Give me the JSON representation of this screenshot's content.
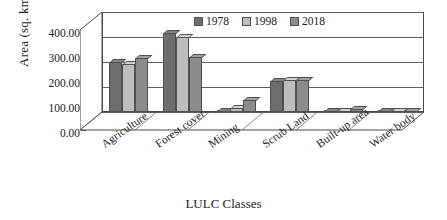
{
  "chart_data": {
    "type": "bar",
    "title": "",
    "xlabel": "LULC Classes",
    "ylabel": "Area (sq. km.)",
    "categories": [
      "Agriculture",
      "Forest cover",
      "Mining",
      "Scrub Land",
      "Built-up area",
      "Water body"
    ],
    "series": [
      {
        "name": "1978",
        "color": "#6e6e6e",
        "values": [
          200.0,
          315.0,
          5.0,
          126.0,
          3.0,
          4.0
        ]
      },
      {
        "name": "1998",
        "color": "#bdbdbd",
        "values": [
          192.0,
          300.0,
          18.0,
          127.0,
          6.0,
          5.0
        ]
      },
      {
        "name": "2018",
        "color": "#8c8c8c",
        "values": [
          215.0,
          222.0,
          50.0,
          128.0,
          11.0,
          5.0
        ]
      }
    ],
    "ylim": [
      0,
      400
    ],
    "ytick_labels": [
      "400.00",
      "300.00",
      "200.00",
      "100.00",
      "0.00"
    ],
    "ytick_values": [
      400,
      300,
      200,
      100,
      0
    ],
    "grid": true,
    "legend_position": "top",
    "style": "3d-clustered-column"
  },
  "axis": {
    "y_title": "Area (sq. km.)",
    "x_title": "LULC Classes"
  },
  "legend": {
    "items": [
      {
        "label": "1978",
        "color": "#6e6e6e"
      },
      {
        "label": "1998",
        "color": "#bdbdbd"
      },
      {
        "label": "2018",
        "color": "#8c8c8c"
      }
    ]
  }
}
